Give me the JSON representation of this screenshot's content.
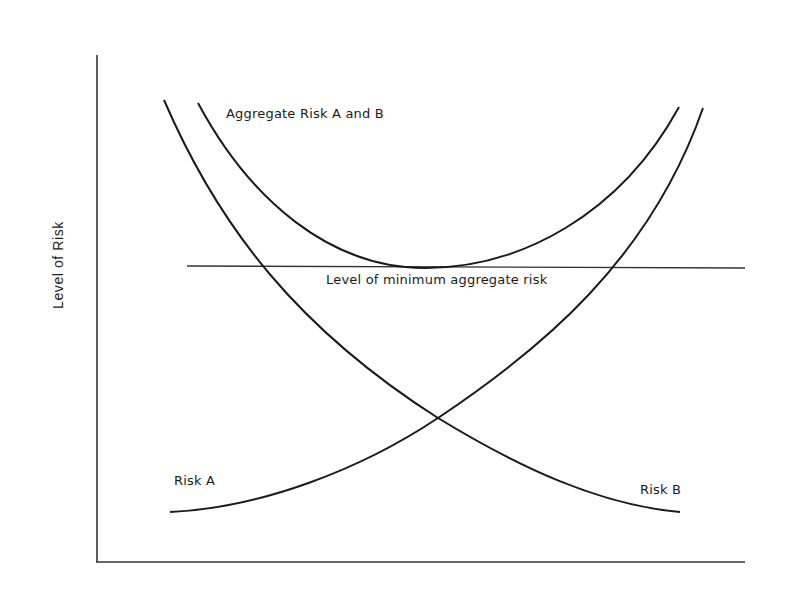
{
  "diagram": {
    "y_axis_label": "Level of Risk",
    "x_axis_label": "",
    "curves": {
      "aggregate": {
        "label": "Aggregate Risk A and B"
      },
      "risk_a": {
        "label": "Risk A"
      },
      "risk_b": {
        "label": "Risk B"
      }
    },
    "reference_line": {
      "label": "Level of minimum aggregate risk"
    },
    "colors": {
      "line": "#1a1a1a",
      "background": "#ffffff"
    }
  }
}
